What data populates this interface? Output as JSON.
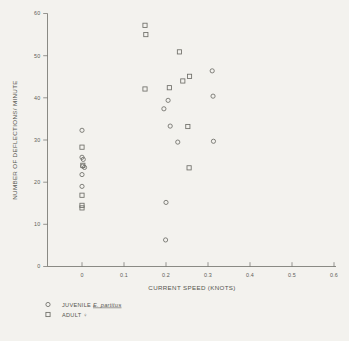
{
  "figure": {
    "background": "#f3f2ee",
    "ink": "#6e6e68"
  },
  "axes": {
    "x_title": "CURRENT SPEED (KNOTS)",
    "y_title": "NUMBER OF DEFLECTIONS/ MINUTE",
    "x_ticks": [
      "0",
      "0.1",
      "0.2",
      "0.3",
      "0.4",
      "0.5",
      "0.6"
    ],
    "y_ticks": [
      "0",
      "10",
      "20",
      "30",
      "40",
      "50",
      "60"
    ]
  },
  "legend": {
    "items": [
      {
        "marker": "circle-open",
        "label": "JUVENILE E. partitus",
        "italic_part": "E. partitus"
      },
      {
        "marker": "square-open",
        "label": "ADULT ♀",
        "italic_part": ""
      }
    ]
  },
  "caption": {
    "text": ""
  },
  "chart_data": {
    "type": "scatter",
    "title": "",
    "xlabel": "CURRENT SPEED (KNOTS)",
    "ylabel": "NUMBER OF DEFLECTIONS/ MINUTE",
    "xlim": [
      0,
      0.6
    ],
    "ylim": [
      0,
      60
    ],
    "xticks": [
      0,
      0.1,
      0.2,
      0.3,
      0.4,
      0.5,
      0.6
    ],
    "yticks": [
      0,
      10,
      20,
      30,
      40,
      50,
      60
    ],
    "grid": false,
    "legend_position": "below-axes-left",
    "series": [
      {
        "name": "JUVENILE E. partitus",
        "marker": "circle-open",
        "points": [
          [
            0.0,
            32.3
          ],
          [
            0.0,
            25.9
          ],
          [
            0.003,
            25.4
          ],
          [
            0.002,
            23.8
          ],
          [
            0.006,
            23.5
          ],
          [
            0.0,
            21.8
          ],
          [
            0.0,
            19.0
          ],
          [
            0.195,
            37.4
          ],
          [
            0.205,
            39.4
          ],
          [
            0.21,
            33.3
          ],
          [
            0.228,
            29.5
          ],
          [
            0.31,
            46.4
          ],
          [
            0.312,
            40.4
          ],
          [
            0.313,
            29.7
          ],
          [
            0.2,
            15.2
          ],
          [
            0.199,
            6.3
          ]
        ]
      },
      {
        "name": "ADULT ♀",
        "marker": "square-open",
        "points": [
          [
            0.0,
            28.3
          ],
          [
            0.002,
            24.0
          ],
          [
            0.0,
            16.9
          ],
          [
            0.0,
            14.5
          ],
          [
            0.0,
            13.9
          ],
          [
            0.15,
            57.2
          ],
          [
            0.152,
            55.0
          ],
          [
            0.15,
            42.1
          ],
          [
            0.232,
            50.9
          ],
          [
            0.208,
            42.4
          ],
          [
            0.24,
            44.0
          ],
          [
            0.256,
            45.1
          ],
          [
            0.252,
            33.2
          ],
          [
            0.255,
            23.4
          ]
        ]
      }
    ]
  }
}
